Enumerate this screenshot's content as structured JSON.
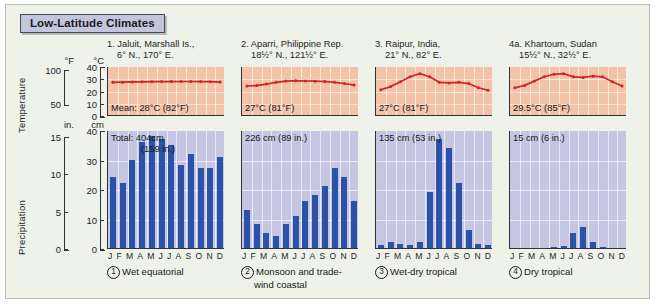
{
  "title": "Low-Latitude Climates",
  "axes": {
    "temperature_label": "Temperature",
    "precipitation_label": "Precipitation",
    "temp_unit_f": "°F",
    "temp_unit_c": "°C",
    "prec_unit_in": "in.",
    "prec_unit_cm": "cm",
    "temp_f_ticks": [
      "100",
      "50"
    ],
    "temp_c_ticks": [
      "40",
      "30",
      "20",
      "10",
      "0"
    ],
    "prec_in_ticks": [
      "15",
      "10",
      "5",
      "0"
    ],
    "prec_cm_ticks": [
      "40",
      "30",
      "20",
      "10",
      "0"
    ],
    "months": [
      "J",
      "F",
      "M",
      "A",
      "M",
      "J",
      "J",
      "A",
      "S",
      "O",
      "N",
      "D"
    ]
  },
  "chart_data": {
    "type": "bar",
    "title": "Low-Latitude Climates",
    "xlabel": "",
    "ylabel": "Precipitation (cm) / Temperature (°C)",
    "categories": [
      "J",
      "F",
      "M",
      "A",
      "M",
      "J",
      "J",
      "A",
      "S",
      "O",
      "N",
      "D"
    ],
    "temp_ylim": [
      0,
      40
    ],
    "prec_ylim": [
      0,
      40
    ],
    "grid": true,
    "legend": "none",
    "panels": [
      {
        "number": "1.",
        "station_line1": "1. Jaluit, Marshall Is.,",
        "station_line2": "6° N., 170° E.",
        "temp_label": "Mean: 28°C (82°F)",
        "prec_label_line1": "Total: 404cm",
        "prec_label_line2": "(159 in.)",
        "caption_number": "1",
        "caption": "Wet equatorial",
        "temperature_c": [
          27.5,
          27.6,
          27.8,
          27.9,
          28.0,
          28.1,
          28.1,
          28.2,
          28.2,
          28.1,
          28.0,
          27.7
        ],
        "precipitation_cm": [
          24,
          22,
          30,
          36,
          38,
          37,
          35,
          28,
          32,
          27,
          27,
          31
        ]
      },
      {
        "number": "2.",
        "station_line1": "2. Aparri, Philippine Rep.",
        "station_line2": "18½° N., 121½° E.",
        "temp_label": "27°C (81°F)",
        "prec_label_line1": "226 cm (89 in.)",
        "prec_label_line2": "",
        "caption_number": "2",
        "caption_line1": "Monsoon and trade-",
        "caption_line2": "wind coastal",
        "temperature_c": [
          24.5,
          24.8,
          26.0,
          27.5,
          28.5,
          28.8,
          28.6,
          28.4,
          28.2,
          27.5,
          26.5,
          25.2
        ],
        "precipitation_cm": [
          13,
          8,
          5,
          4,
          8,
          11,
          16,
          18,
          21,
          27,
          24,
          16
        ]
      },
      {
        "number": "3.",
        "station_line1": "3. Raipur, India,",
        "station_line2": "21° N., 82° E.",
        "temp_label": "27°C (81°F)",
        "prec_label_line1": "135 cm (53 in.)",
        "prec_label_line2": "",
        "caption_number": "3",
        "caption": "Wet-dry tropical",
        "temperature_c": [
          21.5,
          24.0,
          28.0,
          32.0,
          34.5,
          32.0,
          27.5,
          27.0,
          27.5,
          26.5,
          23.0,
          21.0
        ],
        "precipitation_cm": [
          1,
          2,
          1.5,
          1,
          2,
          19,
          37,
          34,
          22,
          6,
          1.5,
          1
        ]
      },
      {
        "number": "4a.",
        "station_line1": "4a. Khartoum, Sudan",
        "station_line2": "15½° N., 32½° E.",
        "temp_label": "29.5°C (85°F)",
        "prec_label_line1": "15 cm (6 in.)",
        "prec_label_line2": "",
        "caption_number": "4",
        "caption": "Dry tropical",
        "temperature_c": [
          23.0,
          25.0,
          28.5,
          32.0,
          34.0,
          34.5,
          32.0,
          31.5,
          32.5,
          32.0,
          28.0,
          24.5
        ],
        "precipitation_cm": [
          0,
          0,
          0,
          0,
          0.2,
          0.8,
          5.0,
          7.0,
          2.0,
          0.5,
          0,
          0
        ]
      }
    ]
  },
  "colors": {
    "temperature_plot_bg": "#f2c3a7",
    "temperature_line": "#d0232b",
    "precipitation_plot_bg": "#c5c6e2",
    "precipitation_bar": "#2a52a8",
    "title_bg": "#c3c5dd",
    "figure_bg": "#eef2e8"
  }
}
